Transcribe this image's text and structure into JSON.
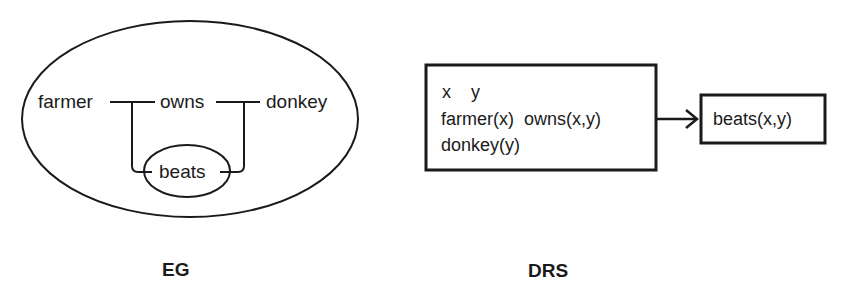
{
  "eg": {
    "caption": "EG",
    "nodes": {
      "farmer": "farmer",
      "owns": "owns",
      "donkey": "donkey",
      "beats": "beats"
    }
  },
  "drs": {
    "caption": "DRS",
    "antecedent": {
      "referents": [
        "x",
        "y"
      ],
      "line1": "x    y",
      "line2": "farmer(x)  owns(x,y)",
      "line3": "donkey(y)"
    },
    "consequent": {
      "condition": "beats(x,y)"
    }
  },
  "colors": {
    "stroke": "#1a1a1a",
    "background": "#ffffff"
  }
}
